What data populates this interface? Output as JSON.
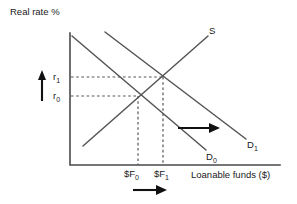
{
  "figure": {
    "type": "economics-supply-demand-diagram",
    "title_visible": false,
    "axes": {
      "y_label": "Real rate %",
      "x_label": "Loanable funds ($)",
      "origin": [
        70,
        165
      ],
      "y_top": [
        70,
        33
      ],
      "x_right": [
        280,
        165
      ]
    },
    "curves": [
      {
        "name": "supply",
        "label": "S",
        "label_main": "S",
        "label_sub": "",
        "label_pos": [
          212,
          31
        ],
        "from": [
          83,
          146
        ],
        "to": [
          208,
          36
        ]
      },
      {
        "name": "demand-initial",
        "label": "D0",
        "label_main": "D",
        "label_sub": "0",
        "label_pos": [
          210,
          157
        ],
        "from": [
          72,
          36
        ],
        "to": [
          206,
          150
        ]
      },
      {
        "name": "demand-shifted",
        "label": "D1",
        "label_main": "D",
        "label_sub": "1",
        "label_pos": [
          250,
          145
        ],
        "from": [
          105,
          32
        ],
        "to": [
          246,
          139
        ]
      }
    ],
    "equilibria": [
      {
        "name": "initial-equilibrium",
        "rate_label_main": "r",
        "rate_label_sub": "0",
        "quantity_label": "$F0",
        "quantity_main": "$F",
        "quantity_sub": "0",
        "point": [
          138,
          96
        ]
      },
      {
        "name": "new-equilibrium",
        "rate_label_main": "r",
        "rate_label_sub": "1",
        "quantity_label": "$F1",
        "quantity_main": "$F",
        "quantity_sub": "1",
        "point": [
          163,
          77
        ]
      }
    ],
    "annotations": [
      {
        "name": "rate-increase-arrow",
        "direction": "up",
        "meaning": "real rate rises from r0 to r1"
      },
      {
        "name": "demand-shift-arrow",
        "direction": "right",
        "meaning": "demand curve shifts right from D0 to D1"
      },
      {
        "name": "quantity-increase-arrow",
        "direction": "right",
        "meaning": "loanable funds quantity rises from $F0 to $F1"
      }
    ],
    "colors": {
      "axis": "#4a4a4a",
      "curve": "#555555",
      "guide": "#555555",
      "arrow": "#111111",
      "text": "#1a1a1a",
      "background": "#ffffff"
    }
  }
}
